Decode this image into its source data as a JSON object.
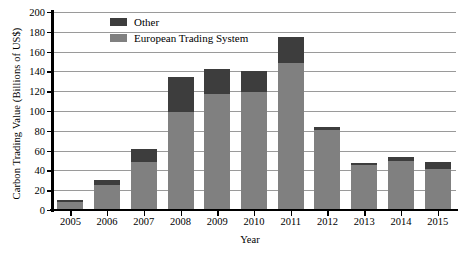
{
  "chart_data": {
    "type": "bar",
    "subtype": "stacked-bar",
    "title": "",
    "xlabel": "Year",
    "ylabel": "Carbon Trading Value (Billions of US$)",
    "categories": [
      "2005",
      "2006",
      "2007",
      "2008",
      "2009",
      "2010",
      "2011",
      "2012",
      "2013",
      "2014",
      "2015"
    ],
    "series": [
      {
        "name": "European Trading System",
        "color": "#808080",
        "values": [
          8,
          25,
          48,
          99,
          117,
          119,
          148,
          81,
          45,
          50,
          41
        ]
      },
      {
        "name": "Other",
        "color": "#3d3d3d",
        "values": [
          2,
          5,
          14,
          35,
          25,
          21,
          27,
          3,
          2,
          4,
          8
        ]
      }
    ],
    "totals": [
      10,
      30,
      62,
      134,
      142,
      140,
      175,
      84,
      47,
      54,
      49
    ],
    "ylim": [
      0,
      200
    ],
    "ytick_step": 20,
    "yticks": [
      "0",
      "20",
      "40",
      "60",
      "80",
      "100",
      "120",
      "140",
      "160",
      "180",
      "200"
    ],
    "grid": "horizontal",
    "legend_position": "top-left-inside",
    "stack_order": [
      "European Trading System",
      "Other"
    ]
  },
  "legend": {
    "items": [
      {
        "label": "Other",
        "color": "#3d3d3d"
      },
      {
        "label": "European Trading System",
        "color": "#808080"
      }
    ]
  }
}
